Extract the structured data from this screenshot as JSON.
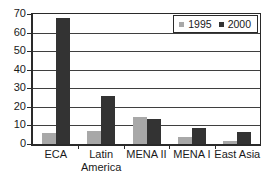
{
  "chart_data": {
    "type": "bar",
    "title": "",
    "xlabel": "",
    "ylabel": "",
    "categories": [
      "ECA",
      "Latin America",
      "MENA II",
      "MENA I",
      "East Asia"
    ],
    "series": [
      {
        "name": "1995",
        "color": "#a8a8a8",
        "values": [
          6,
          7,
          14.5,
          4,
          1.5
        ]
      },
      {
        "name": "2000",
        "color": "#333333",
        "values": [
          68,
          26,
          13.5,
          8.5,
          6.5
        ]
      }
    ],
    "ylim": [
      0,
      70
    ],
    "yticks": [
      0,
      10,
      20,
      30,
      40,
      50,
      60,
      70
    ],
    "grid": true,
    "grid_color": "#3f3f3f",
    "axis_color": "#2a2a2a",
    "legend_position": "top-right"
  }
}
